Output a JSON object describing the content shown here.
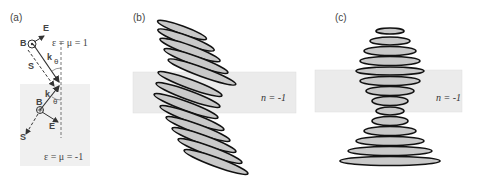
{
  "figure": {
    "panels": [
      {
        "label": "(a)",
        "top_medium": "ε = μ = 1",
        "bottom_medium": "ε = μ = -1",
        "vectors_top": [
          "B",
          "E",
          "k",
          "S"
        ],
        "vectors_bottom": [
          "B",
          "E",
          "k",
          "S"
        ],
        "angle_symbol": "θ"
      },
      {
        "label": "(b)",
        "slab_label": "n = -1"
      },
      {
        "label": "(c)",
        "slab_label": "n = -1"
      }
    ],
    "colors": {
      "slab": "#ebebeb",
      "lower_medium": "#f0f0f0",
      "wave_dark": "#111111",
      "wave_mid": "#9a9a9a",
      "wave_light": "#c9c9c9"
    }
  }
}
